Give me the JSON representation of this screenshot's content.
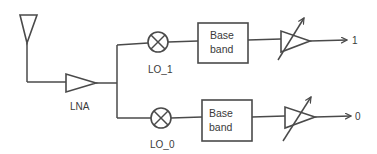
{
  "diagram": {
    "type": "receiver-block-diagram",
    "colors": {
      "line": "#4a4a4a",
      "text": "#3a3a3a",
      "background": "#ffffff"
    },
    "antenna": {
      "icon": "antenna-icon"
    },
    "lna": {
      "label": "LNA",
      "icon": "amplifier-icon"
    },
    "branches": [
      {
        "mixer": {
          "label": "LO_1",
          "icon": "mixer-icon"
        },
        "baseband": {
          "line1": "Base",
          "line2": "band"
        },
        "vga": {
          "icon": "variable-gain-amplifier-icon"
        },
        "output": {
          "label": "1"
        }
      },
      {
        "mixer": {
          "label": "LO_0",
          "icon": "mixer-icon"
        },
        "baseband": {
          "line1": "Base",
          "line2": "band"
        },
        "vga": {
          "icon": "variable-gain-amplifier-icon"
        },
        "output": {
          "label": "0"
        }
      }
    ]
  }
}
